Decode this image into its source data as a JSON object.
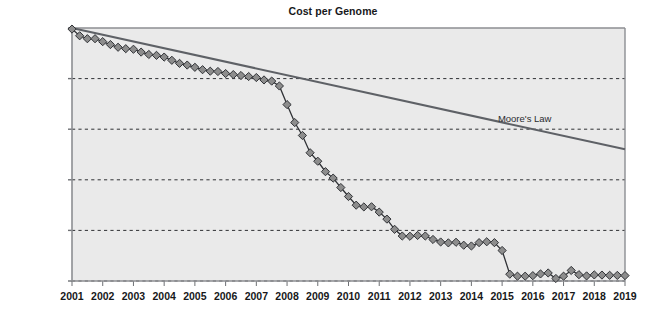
{
  "chart_data": {
    "type": "line",
    "title": "Cost per Genome",
    "xlabel": "",
    "ylabel": "",
    "scale": "log",
    "grid": true,
    "legend_position": "inline-annotation",
    "xlim": [
      2001,
      2019
    ],
    "ylim": [
      1000,
      100000000
    ],
    "x_tick_labels": [
      "2001",
      "2002",
      "2003",
      "2004",
      "2005",
      "2006",
      "2007",
      "2008",
      "2009",
      "2010",
      "2011",
      "2012",
      "2013",
      "2014",
      "2015",
      "2016",
      "2017",
      "2018",
      "2019"
    ],
    "y_tick_labels": [
      "$100M",
      "$10M",
      "$1M",
      "$100K",
      "$10K",
      "$1K"
    ],
    "y_tick_values": [
      100000000,
      10000000,
      1000000,
      100000,
      10000,
      1000
    ],
    "annotations": [
      {
        "text": "Moore's Law",
        "x": 2016.1,
        "y": 1600000
      }
    ],
    "series": [
      {
        "name": "Cost per Genome",
        "marker": "diamond",
        "color": "#8d8d8d",
        "line_color": "#303236",
        "x": [
          2001.0,
          2001.25,
          2001.5,
          2001.75,
          2002.0,
          2002.25,
          2002.5,
          2002.75,
          2003.0,
          2003.25,
          2003.5,
          2003.75,
          2004.0,
          2004.25,
          2004.5,
          2004.75,
          2005.0,
          2005.25,
          2005.5,
          2005.75,
          2006.0,
          2006.25,
          2006.5,
          2006.75,
          2007.0,
          2007.25,
          2007.5,
          2007.75,
          2008.0,
          2008.25,
          2008.5,
          2008.75,
          2009.0,
          2009.25,
          2009.5,
          2009.75,
          2010.0,
          2010.25,
          2010.5,
          2010.75,
          2011.0,
          2011.25,
          2011.5,
          2011.75,
          2012.0,
          2012.25,
          2012.5,
          2012.75,
          2013.0,
          2013.25,
          2013.5,
          2013.75,
          2014.0,
          2014.25,
          2014.5,
          2014.75,
          2015.0,
          2015.25,
          2015.5,
          2015.75,
          2016.0,
          2016.25,
          2016.5,
          2016.75,
          2017.0,
          2017.25,
          2017.5,
          2017.75,
          2018.0,
          2018.25,
          2018.5,
          2018.75,
          2019.0
        ],
        "y": [
          95263072,
          70175437,
          61448422,
          61448422,
          53751684,
          47065072,
          41623134,
          39006000,
          38023115,
          33403000,
          30000000,
          28780376,
          26626400,
          23000000,
          20000000,
          18519312,
          16712371,
          15000000,
          14000000,
          13801124,
          12586000,
          12000000,
          11500000,
          11000000,
          10497000,
          9408739,
          8927342,
          7147571,
          3063820,
          1352982,
          752080,
          342502,
          232735,
          144731,
          108065,
          70333,
          46774,
          31512,
          29092,
          29306,
          23000,
          16712,
          10497,
          7743,
          7666,
          7950,
          7742,
          6618,
          5901,
          5671,
          5826,
          5096,
          4920,
          5731,
          5963,
          5731,
          4008,
          1363,
          1245,
          1245,
          1275,
          1380,
          1442,
          1121,
          1245,
          1615,
          1334,
          1261,
          1320,
          1310,
          1295,
          1290,
          1280
        ]
      },
      {
        "name": "Moore's Law",
        "marker": "none",
        "color": "#5e6166",
        "x": [
          2001.0,
          2019.0
        ],
        "y": [
          100000000,
          400000
        ]
      }
    ]
  },
  "geometry": {
    "plot_left": 72,
    "plot_right": 625,
    "plot_top": 28,
    "plot_bottom": 281,
    "gridline_y": [
      28,
      71.4,
      114.8,
      158.2,
      201.6,
      245
    ],
    "plot_bg": "#eaeaea",
    "plot_border": "#8c8e92",
    "grid_color": "#2f3134",
    "page_bg": "#ffffff"
  }
}
